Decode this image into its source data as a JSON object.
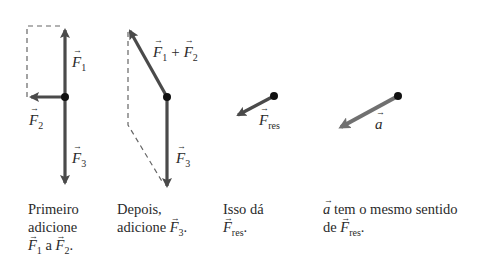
{
  "colors": {
    "arrow_dark": "#4a4a4a",
    "arrow_light": "#707070",
    "dot": "#111111",
    "dashed": "#666666",
    "text": "#2a2a2a"
  },
  "panels": [
    {
      "id": "step1",
      "vector_labels": {
        "f1": {
          "symbol": "F",
          "sub": "1"
        },
        "f2": {
          "symbol": "F",
          "sub": "2"
        },
        "f3": {
          "symbol": "F",
          "sub": "3"
        }
      },
      "caption": {
        "line1": "Primeiro",
        "line2": "adicione",
        "line3_a": "F",
        "line3_a_sub": "1",
        "line3_mid": " a ",
        "line3_b": "F",
        "line3_b_sub": "2",
        "line3_end": "."
      }
    },
    {
      "id": "step2",
      "vector_labels": {
        "f12": {
          "a": "F",
          "a_sub": "1",
          "plus": "+",
          "b": "F",
          "b_sub": "2"
        },
        "f3": {
          "symbol": "F",
          "sub": "3"
        }
      },
      "caption": {
        "line1": "Depois,",
        "line2_text": "adicione ",
        "line2_vec": "F",
        "line2_sub": "3",
        "line2_end": "."
      }
    },
    {
      "id": "step3",
      "vector_labels": {
        "fres": {
          "symbol": "F",
          "sub": "res"
        }
      },
      "caption": {
        "line1": "Isso dá",
        "line2_vec": "F",
        "line2_sub": "res",
        "line2_end": "."
      }
    },
    {
      "id": "step4",
      "vector_labels": {
        "a": {
          "symbol": "a"
        }
      },
      "caption": {
        "line1_vec": "a",
        "line1_text": " tem o mesmo sentido",
        "line2_text": "de ",
        "line2_vec": "F",
        "line2_sub": "res",
        "line2_end": "."
      }
    }
  ]
}
